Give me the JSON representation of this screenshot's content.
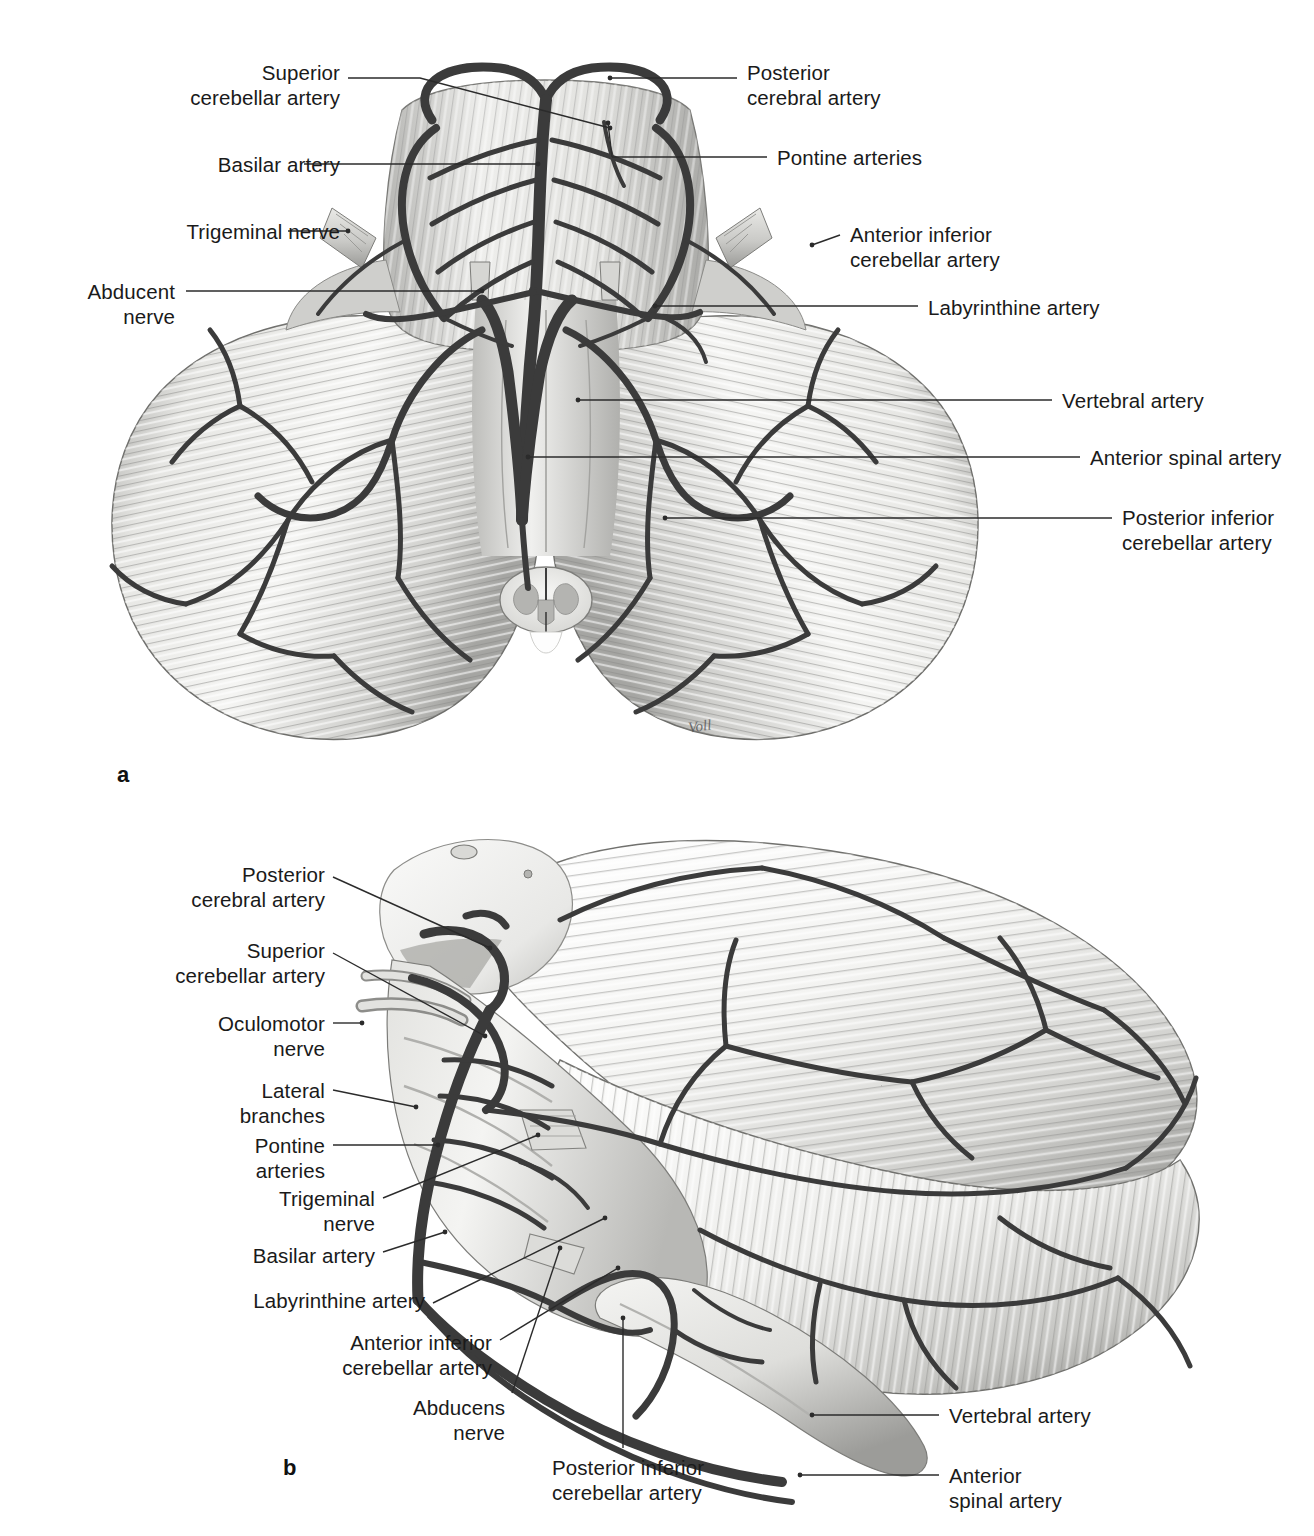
{
  "figure_a": {
    "marker": "a",
    "signature": "Voll",
    "labels_left": [
      {
        "id": "superior-cerebellar-artery",
        "text": "Superior\ncerebellar artery",
        "x": 165,
        "y": 60,
        "w": 175,
        "lead": [
          [
            348,
            78
          ],
          [
            420,
            78
          ],
          [
            610,
            128
          ]
        ]
      },
      {
        "id": "basilar-artery",
        "text": "Basilar artery",
        "x": 180,
        "y": 152,
        "w": 160,
        "lead": [
          [
            304,
            164
          ],
          [
            538,
            164
          ]
        ]
      },
      {
        "id": "trigeminal-nerve",
        "text": "Trigeminal nerve",
        "x": 125,
        "y": 219,
        "w": 215,
        "lead": [
          [
            288,
            231
          ],
          [
            348,
            231
          ]
        ]
      },
      {
        "id": "abducent-nerve",
        "text": "Abducent\nnerve",
        "x": 55,
        "y": 279,
        "w": 120,
        "lead": [
          [
            186,
            291
          ],
          [
            482,
            291
          ]
        ]
      }
    ],
    "labels_right": [
      {
        "id": "posterior-cerebral-artery",
        "text": "Posterior\ncerebral artery",
        "x": 747,
        "y": 60,
        "w": 200,
        "lead": [
          [
            737,
            78
          ],
          [
            610,
            78
          ]
        ]
      },
      {
        "id": "pontine-arteries",
        "text": "Pontine arteries",
        "x": 777,
        "y": 145,
        "w": 200,
        "lead": [
          [
            767,
            157
          ],
          [
            612,
            157
          ],
          [
            608,
            123
          ]
        ]
      },
      {
        "id": "anterior-inferior-cerebellar-artery",
        "text": "Anterior inferior\ncerebellar artery",
        "x": 850,
        "y": 222,
        "w": 220,
        "lead": [
          [
            840,
            235
          ],
          [
            812,
            245
          ],
          [
            620,
            300
          ]
        ]
      },
      {
        "id": "labyrinthine-artery",
        "text": "Labyrinthine artery",
        "x": 928,
        "y": 295,
        "w": 240,
        "lead": [
          [
            918,
            306
          ],
          [
            655,
            306
          ]
        ]
      },
      {
        "id": "vertebral-artery",
        "text": "Vertebral artery",
        "x": 1062,
        "y": 388,
        "w": 210,
        "lead": [
          [
            1052,
            400
          ],
          [
            578,
            400
          ]
        ]
      },
      {
        "id": "anterior-spinal-artery",
        "text": "Anterior spinal artery",
        "x": 1090,
        "y": 445,
        "w": 215,
        "lead": [
          [
            1080,
            457
          ],
          [
            528,
            457
          ]
        ]
      },
      {
        "id": "posterior-inferior-cerebellar-artery",
        "text": "Posterior inferior\ncerebellar artery",
        "x": 1122,
        "y": 505,
        "w": 195,
        "lead": [
          [
            1112,
            518
          ],
          [
            665,
            518
          ]
        ]
      }
    ]
  },
  "figure_b": {
    "marker": "b",
    "labels_left": [
      {
        "id": "posterior-cerebral-artery",
        "text": "Posterior\ncerebral artery",
        "x": 180,
        "y": 862,
        "w": 145,
        "lead": [
          [
            333,
            877
          ],
          [
            490,
            948
          ]
        ]
      },
      {
        "id": "superior-cerebellar-artery",
        "text": "Superior\ncerebellar artery",
        "x": 160,
        "y": 938,
        "w": 165,
        "lead": [
          [
            333,
            953
          ],
          [
            485,
            1036
          ]
        ]
      },
      {
        "id": "oculomotor-nerve",
        "text": "Oculomotor\nnerve",
        "x": 200,
        "y": 1011,
        "w": 125,
        "lead": [
          [
            333,
            1023
          ],
          [
            362,
            1023
          ]
        ]
      },
      {
        "id": "lateral-branches",
        "text": "Lateral\nbranches",
        "x": 237,
        "y": 1078,
        "w": 88,
        "lead": [
          [
            333,
            1090
          ],
          [
            416,
            1107
          ]
        ]
      },
      {
        "id": "pontine-arteries",
        "text": "Pontine\narteries",
        "x": 240,
        "y": 1133,
        "w": 85,
        "lead": [
          [
            333,
            1145
          ],
          [
            438,
            1145
          ]
        ]
      },
      {
        "id": "trigeminal-nerve",
        "text": "Trigeminal\nnerve",
        "x": 243,
        "y": 1186,
        "w": 130,
        "lead": [
          [
            383,
            1198
          ],
          [
            538,
            1135
          ]
        ]
      },
      {
        "id": "basilar-artery",
        "text": "Basilar artery",
        "x": 228,
        "y": 1243,
        "w": 145,
        "lead": [
          [
            383,
            1252
          ],
          [
            445,
            1232
          ]
        ]
      },
      {
        "id": "labyrinthine-artery",
        "text": "Labyrinthine artery",
        "x": 222,
        "y": 1298,
        "w": 200,
        "lead": [
          [
            433,
            1303
          ],
          [
            605,
            1218
          ]
        ]
      },
      {
        "id": "anterior-inferior-cerebellar-artery",
        "text": "Anterior inferior\ncerebellar artery",
        "x": 292,
        "y": 1330,
        "w": 195,
        "lead": [
          [
            500,
            1340
          ],
          [
            618,
            1268
          ]
        ]
      },
      {
        "id": "abducens-nerve",
        "text": "Abducens\nnerve",
        "x": 448,
        "y": 1395,
        "w": 110,
        "lead": [
          [
            512,
            1393
          ],
          [
            560,
            1248
          ]
        ]
      },
      {
        "id": "posterior-inferior-cerebellar-artery",
        "text": "Posterior inferior\ncerebellar artery",
        "x": 552,
        "y": 1455,
        "w": 195,
        "lead": [
          [
            623,
            1448
          ],
          [
            623,
            1318
          ]
        ]
      }
    ],
    "labels_right": [
      {
        "id": "vertebral-artery",
        "text": "Vertebral artery",
        "x": 949,
        "y": 1403,
        "w": 195,
        "lead": [
          [
            939,
            1415
          ],
          [
            812,
            1415
          ]
        ]
      },
      {
        "id": "anterior-spinal-artery",
        "text": "Anterior\nspinal artery",
        "x": 949,
        "y": 1463,
        "w": 160,
        "lead": [
          [
            939,
            1475
          ],
          [
            800,
            1475
          ]
        ]
      }
    ]
  },
  "colors": {
    "ink": "#1a1a1a",
    "leader": "#2b2b2b",
    "vessel_dark": "#3a3a3a",
    "tissue_light": "#f2f2f0",
    "tissue_mid": "#c9c9c6",
    "tissue_shadow": "#8e8e8b",
    "background": "#ffffff"
  }
}
